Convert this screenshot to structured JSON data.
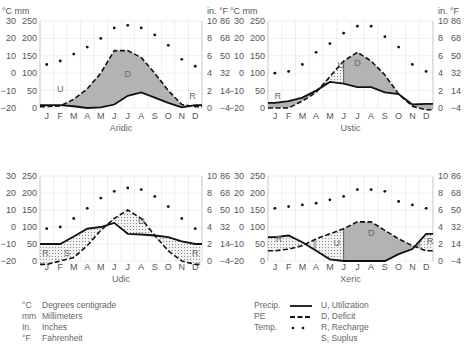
{
  "units_header": {
    "left": "°C mm",
    "right": "in.  °F"
  },
  "axes": {
    "celsius": [
      "30",
      "20",
      "10",
      "0",
      "−10",
      "−20"
    ],
    "mm": [
      "250",
      "200",
      "150",
      "100",
      "50",
      "0"
    ],
    "inches": [
      "10",
      "8",
      "6",
      "4",
      "2",
      "0"
    ],
    "fahrenheit": [
      "86",
      "68",
      "50",
      "32",
      "14",
      "−4"
    ],
    "months": [
      "J",
      "F",
      "M",
      "A",
      "M",
      "J",
      "J",
      "A",
      "S",
      "O",
      "N",
      "D"
    ]
  },
  "chart_data": [
    {
      "type": "line",
      "title": "Aridic",
      "x": [
        "J",
        "F",
        "M",
        "A",
        "M",
        "J",
        "J",
        "A",
        "S",
        "O",
        "N",
        "D"
      ],
      "ylim_mm": [
        0,
        250
      ],
      "series": [
        {
          "name": "Precip. (mm)",
          "values": [
            8,
            8,
            5,
            0,
            2,
            10,
            35,
            45,
            30,
            15,
            2,
            8
          ]
        },
        {
          "name": "PE (mm)",
          "values": [
            4,
            6,
            25,
            55,
            100,
            165,
            165,
            145,
            100,
            50,
            10,
            4
          ]
        },
        {
          "name": "Temp. (°C)",
          "values": [
            5,
            7,
            11,
            15,
            20,
            26,
            27.5,
            26,
            22,
            16,
            8,
            4
          ]
        }
      ],
      "zones": [
        "U",
        "D",
        "R"
      ]
    },
    {
      "type": "line",
      "title": "Ustic",
      "x": [
        "J",
        "F",
        "M",
        "A",
        "M",
        "J",
        "J",
        "A",
        "S",
        "O",
        "N",
        "D"
      ],
      "ylim_mm": [
        0,
        250
      ],
      "series": [
        {
          "name": "Precip. (mm)",
          "values": [
            15,
            20,
            30,
            50,
            75,
            70,
            60,
            60,
            45,
            40,
            10,
            12
          ]
        },
        {
          "name": "PE (mm)",
          "values": [
            0,
            0,
            20,
            45,
            90,
            135,
            160,
            135,
            95,
            40,
            5,
            -5
          ]
        },
        {
          "name": "Temp. (°C)",
          "values": [
            0,
            1,
            5,
            12,
            17,
            23,
            27,
            27,
            21,
            15,
            5,
            1
          ]
        }
      ],
      "zones": [
        "R",
        "U",
        "D"
      ]
    },
    {
      "type": "line",
      "title": "Udic",
      "x": [
        "J",
        "F",
        "M",
        "A",
        "M",
        "J",
        "J",
        "A",
        "S",
        "O",
        "N",
        "D"
      ],
      "ylim_mm": [
        0,
        250
      ],
      "series": [
        {
          "name": "Precip. (mm)",
          "values": [
            50,
            50,
            72,
            95,
            100,
            112,
            80,
            78,
            75,
            70,
            58,
            50
          ]
        },
        {
          "name": "PE (mm)",
          "values": [
            -10,
            0,
            10,
            45,
            90,
            125,
            150,
            125,
            75,
            30,
            0,
            -10
          ]
        },
        {
          "name": "Temp. (°C)",
          "values": [
            -1,
            0,
            5,
            11,
            17,
            21,
            23,
            22,
            18,
            12,
            5,
            -1
          ]
        }
      ],
      "zones": [
        "R",
        "S",
        "U",
        "R"
      ]
    },
    {
      "type": "line",
      "title": "Xeric",
      "x": [
        "J",
        "F",
        "M",
        "A",
        "M",
        "J",
        "J",
        "A",
        "S",
        "O",
        "N",
        "D"
      ],
      "ylim_mm": [
        0,
        250
      ],
      "series": [
        {
          "name": "Precip. (mm)",
          "values": [
            70,
            75,
            55,
            30,
            5,
            0,
            0,
            0,
            0,
            20,
            35,
            80
          ]
        },
        {
          "name": "PE (mm)",
          "values": [
            30,
            35,
            45,
            65,
            80,
            95,
            115,
            115,
            90,
            65,
            45,
            30
          ]
        },
        {
          "name": "Temp. (°C)",
          "values": [
            11,
            12,
            13,
            14,
            16,
            18,
            22,
            22,
            21,
            15,
            13,
            11
          ]
        }
      ],
      "zones": [
        "R",
        "U",
        "D",
        "R"
      ]
    }
  ],
  "plots": [
    {
      "title": "Aridic",
      "zone_labels": [
        {
          "t": "U"
        },
        {
          "t": "D"
        },
        {
          "t": "R"
        }
      ]
    },
    {
      "title": "Ustic",
      "zone_labels": [
        {
          "t": "R"
        },
        {
          "t": "U"
        },
        {
          "t": "D"
        }
      ]
    },
    {
      "title": "Udic",
      "zone_labels": [
        {
          "t": "R"
        },
        {
          "t": "S"
        },
        {
          "t": "U"
        },
        {
          "t": "R"
        }
      ]
    },
    {
      "title": "Xeric",
      "zone_labels": [
        {
          "t": "R"
        },
        {
          "t": "U"
        },
        {
          "t": "D"
        },
        {
          "t": "R"
        }
      ]
    }
  ],
  "legend_units": [
    {
      "abbr": "°C",
      "text": "Degrees centigrade"
    },
    {
      "abbr": "mm",
      "text": "Millimeters"
    },
    {
      "abbr": "In.",
      "text": "Inches"
    },
    {
      "abbr": "°F",
      "text": "Fahrenheit"
    }
  ],
  "legend_series": [
    {
      "label": "Precip.",
      "style": "solid"
    },
    {
      "label": "PE",
      "style": "dashed"
    },
    {
      "label": "Temp.",
      "style": "dots"
    }
  ],
  "legend_zones": [
    "U, Utilization",
    "D, Deficit",
    "R, Recharge",
    "S, Suplus"
  ]
}
